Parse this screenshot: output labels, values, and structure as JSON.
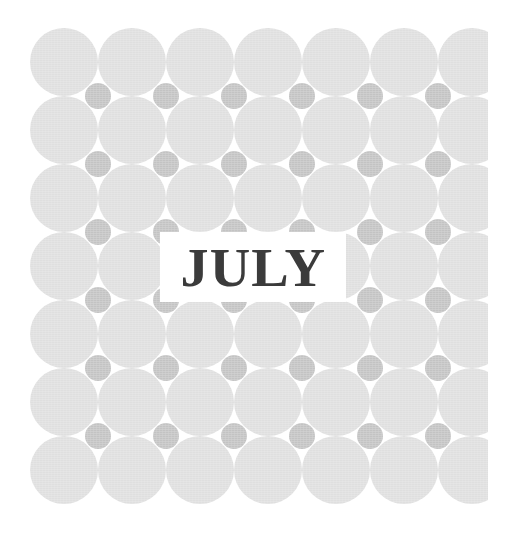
{
  "page": {
    "kind": "calendar-month-cover",
    "background_color": "#ffffff",
    "width": 514,
    "height": 534
  },
  "title": {
    "text": "JULY",
    "color": "#3b3b3b",
    "plate_color": "#ffffff"
  },
  "pattern": {
    "name": "polka-dot-grid",
    "big_dot_color": "#dfdfdf",
    "small_dot_color": "#c3c3c3",
    "columns": 7,
    "rows": 7,
    "big_dot_diameter": 68,
    "small_dot_diameter": 26,
    "cell_size": 68,
    "plate": {
      "left": 30,
      "top": 28,
      "width": 458,
      "height": 478
    }
  }
}
